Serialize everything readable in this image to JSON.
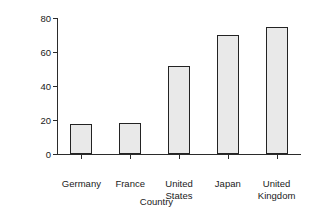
{
  "chart_data": {
    "type": "bar",
    "title": "",
    "xlabel": "Country",
    "ylabel": "Market capital/GDP (%)",
    "categories": [
      "Germany",
      "France",
      "United States",
      "Japan",
      "United Kingdom"
    ],
    "values": [
      17.5,
      18.5,
      52,
      70,
      74.5
    ],
    "ylim": [
      0,
      80
    ],
    "yticks": [
      0,
      20,
      40,
      60,
      80
    ],
    "ytick_labels": [
      "0",
      "20",
      "40",
      "60",
      "80"
    ],
    "grid": false,
    "legend": false,
    "legend_position": "none",
    "bar_fill_color": "#e9e9e9",
    "bar_edge_color": "#232323",
    "background_color": "#ffffff",
    "axis_color": "#2b2b2b"
  },
  "axes": {
    "y_title": "Market capital/GDP (%)",
    "x_title": "Country"
  },
  "x_labels_wrapped": [
    "Germany",
    "France",
    "United\nStates",
    "Japan",
    "United\nKingdom"
  ]
}
